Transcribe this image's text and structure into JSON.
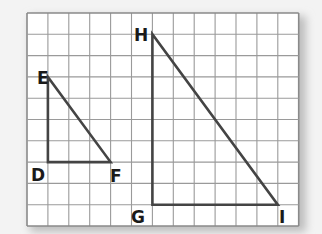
{
  "diagram": {
    "type": "similar right triangles on grid",
    "grid": {
      "columns": 13,
      "rows": 10,
      "origin_px": [
        27,
        13
      ],
      "cell_w": 20.9,
      "cell_h": 21.3,
      "line_color": "#9a9a9a",
      "border_color": "#8a8a8a",
      "paper_color": "#ffffff"
    },
    "stroke_color": "#444444",
    "triangles": [
      {
        "name": "DEF",
        "vertices": {
          "E": [
            1,
            3
          ],
          "D": [
            1,
            7
          ],
          "F": [
            4,
            7
          ]
        },
        "right_angle_at": "D"
      },
      {
        "name": "HGI",
        "vertices": {
          "H": [
            6,
            1
          ],
          "G": [
            6,
            9
          ],
          "I": [
            12,
            9
          ]
        },
        "right_angle_at": "G"
      }
    ],
    "labels": [
      {
        "text": "E",
        "x": 37,
        "y": 84
      },
      {
        "text": "D",
        "x": 31,
        "y": 181
      },
      {
        "text": "F",
        "x": 110,
        "y": 182
      },
      {
        "text": "H",
        "x": 134,
        "y": 41
      },
      {
        "text": "G",
        "x": 131,
        "y": 223
      },
      {
        "text": "I",
        "x": 279,
        "y": 223
      }
    ]
  }
}
